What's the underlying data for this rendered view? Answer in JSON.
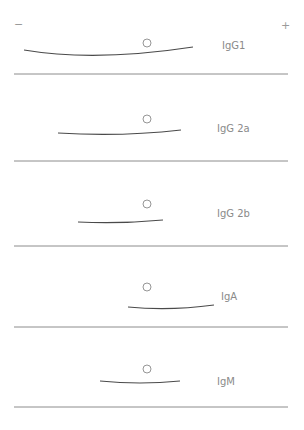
{
  "figure": {
    "type": "immunoelectrophoresis-diagram",
    "poles": {
      "negative": "−",
      "positive": "+"
    },
    "colors": {
      "arc": "#4a4a4a",
      "divider": "#8c8c8c",
      "well": "#8a8a8a",
      "text": "#8a8a8a"
    },
    "lanes": [
      {
        "label": "IgG1",
        "arc": {
          "x1": 24,
          "y1": 50,
          "cx": 95,
          "cy": 62,
          "x2": 193,
          "y2": 47
        },
        "well": {
          "x": 147,
          "y": 43
        },
        "label_pos": {
          "x": 222,
          "y": 49
        },
        "divider_y": 74
      },
      {
        "label": "IgG 2a",
        "arc": {
          "x1": 58,
          "y1": 133,
          "cx": 120,
          "cy": 137,
          "x2": 181,
          "y2": 130
        },
        "well": {
          "x": 147,
          "y": 119
        },
        "label_pos": {
          "x": 217,
          "y": 132
        },
        "divider_y": 161
      },
      {
        "label": "IgG 2b",
        "arc": {
          "x1": 78,
          "y1": 222,
          "cx": 120,
          "cy": 224,
          "x2": 163,
          "y2": 220
        },
        "well": {
          "x": 147,
          "y": 204
        },
        "label_pos": {
          "x": 217,
          "y": 217
        },
        "divider_y": 246
      },
      {
        "label": "IgA",
        "arc": {
          "x1": 128,
          "y1": 307,
          "cx": 170,
          "cy": 311,
          "x2": 214,
          "y2": 305
        },
        "well": {
          "x": 147,
          "y": 287
        },
        "label_pos": {
          "x": 221,
          "y": 300
        },
        "divider_y": 327
      },
      {
        "label": "IgM",
        "arc": {
          "x1": 100,
          "y1": 381,
          "cx": 140,
          "cy": 385,
          "x2": 180,
          "y2": 381
        },
        "well": {
          "x": 147,
          "y": 369
        },
        "label_pos": {
          "x": 217,
          "y": 385
        },
        "divider_y": 407
      }
    ]
  }
}
